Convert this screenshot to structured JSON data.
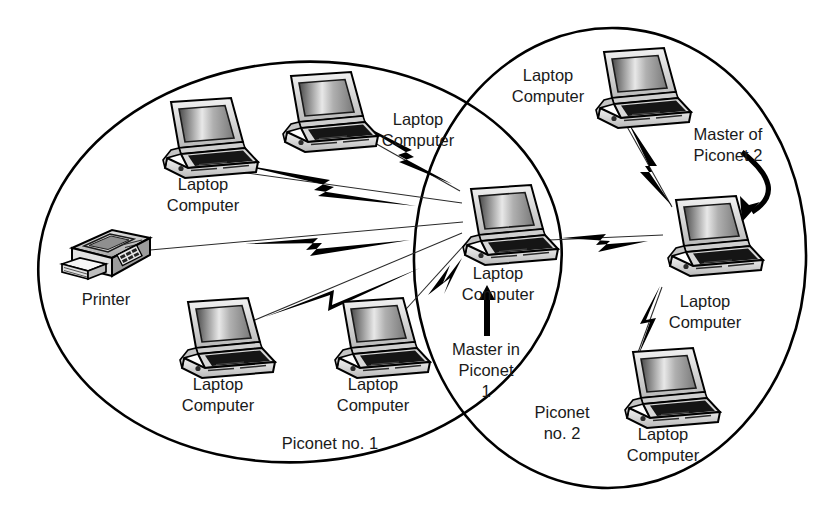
{
  "diagram": {
    "colors": {
      "ink": "#000000",
      "text": "#1a1a1a",
      "background": "#ffffff"
    },
    "groups": [
      {
        "id": "piconet-1",
        "label": "Piconet no. 1",
        "label_x": 330,
        "label_y": 443,
        "cx": 300,
        "cy": 262,
        "rx": 262,
        "ry": 200,
        "rotate": -4
      },
      {
        "id": "piconet-2",
        "label_lines": [
          "Piconet",
          "no. 2"
        ],
        "label_x": 562,
        "label_y": 412,
        "cx": 610,
        "cy": 258,
        "rx": 196,
        "ry": 230,
        "rotate": 2
      }
    ],
    "nodes": [
      {
        "id": "laptop-1",
        "type": "laptop",
        "x": 155,
        "y": 98,
        "scale": 1.0,
        "label_lines": [
          "Laptop",
          "Computer"
        ],
        "label_x": 203,
        "label_y": 183
      },
      {
        "id": "laptop-2",
        "type": "laptop",
        "x": 275,
        "y": 72,
        "scale": 1.0,
        "label_lines": [
          "Laptop",
          "Computer"
        ],
        "label_x": 418,
        "label_y": 118
      },
      {
        "id": "printer-1",
        "type": "printer",
        "x": 60,
        "y": 228,
        "scale": 1.0,
        "label_lines": [
          "Printer"
        ],
        "label_x": 106,
        "label_y": 298
      },
      {
        "id": "laptop-3",
        "type": "laptop",
        "x": 172,
        "y": 298,
        "scale": 1.0,
        "label_lines": [
          "Laptop",
          "Computer"
        ],
        "label_x": 218,
        "label_y": 383
      },
      {
        "id": "laptop-4",
        "type": "laptop",
        "x": 327,
        "y": 298,
        "scale": 1.0,
        "label_lines": [
          "Laptop",
          "Computer"
        ],
        "label_x": 373,
        "label_y": 383
      },
      {
        "id": "laptop-master-1",
        "type": "laptop",
        "x": 455,
        "y": 185,
        "scale": 1.0,
        "label_lines": [
          "Laptop",
          "Computer"
        ],
        "label_x": 498,
        "label_y": 272
      },
      {
        "id": "laptop-5",
        "type": "laptop",
        "x": 588,
        "y": 48,
        "scale": 1.0,
        "label_lines": [
          "Laptop",
          "Computer"
        ],
        "label_x": 548,
        "label_y": 74
      },
      {
        "id": "laptop-master-2",
        "type": "laptop",
        "x": 660,
        "y": 196,
        "scale": 1.0,
        "label_lines": [
          "Laptop",
          "Computer"
        ],
        "label_x": 705,
        "label_y": 300
      },
      {
        "id": "laptop-6",
        "type": "laptop",
        "x": 617,
        "y": 348,
        "scale": 1.0,
        "label_lines": [
          "Laptop",
          "Computer"
        ],
        "label_x": 663,
        "label_y": 433
      }
    ],
    "annotations": [
      {
        "id": "master-in-piconet-1",
        "lines": [
          "Master in",
          "Piconet",
          "1"
        ],
        "x": 486,
        "y": 355,
        "arrow": "up"
      },
      {
        "id": "master-of-piconet-2",
        "lines": [
          "Master of",
          "Piconet 2"
        ],
        "x": 728,
        "y": 133,
        "arrow": "curve-down-left"
      }
    ],
    "links": [
      {
        "from": "laptop-2",
        "to": "laptop-master-1",
        "style": "bolt"
      },
      {
        "from": "laptop-1",
        "to": "laptop-master-1",
        "style": "bolt"
      },
      {
        "from": "printer-1",
        "to": "laptop-master-1",
        "style": "bolt"
      },
      {
        "from": "laptop-3",
        "to": "laptop-master-1",
        "style": "bolt"
      },
      {
        "from": "laptop-4",
        "to": "laptop-master-1",
        "style": "bolt"
      },
      {
        "from": "laptop-master-1",
        "to": "laptop-master-2",
        "style": "bolt"
      },
      {
        "from": "laptop-5",
        "to": "laptop-master-2",
        "style": "bolt"
      },
      {
        "from": "laptop-6",
        "to": "laptop-master-2",
        "style": "bolt"
      }
    ]
  }
}
